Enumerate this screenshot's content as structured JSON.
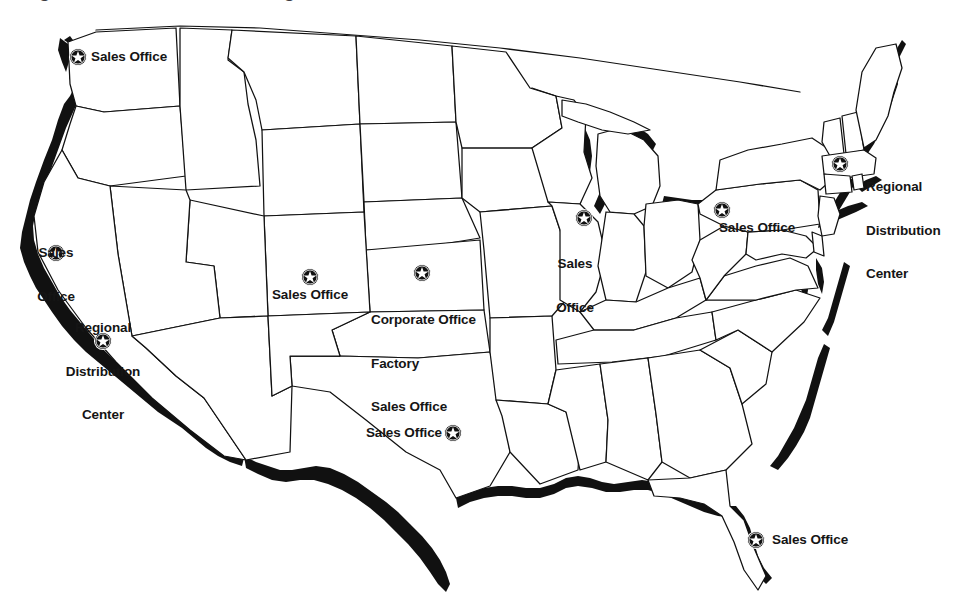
{
  "page": {
    "title_fragment": "Regional sales, manufacturing and distribution locations",
    "background_color": "#ffffff",
    "ink_color": "#111111",
    "width": 968,
    "height": 611
  },
  "map": {
    "name": "united-states-map",
    "region": "Continental United States",
    "outline_color": "#111111",
    "fill_color": "#ffffff",
    "coastline_style": "thick black shadow band"
  },
  "legend_terms": {
    "sales_office": "Sales Office",
    "regional_distribution_center": "Regional Distribution Center",
    "corporate_office": "Corporate Office",
    "factory": "Factory"
  },
  "markers": [
    {
      "id": "marker-washington",
      "icon": "star-in-circle-icon",
      "state": "Washington",
      "label_lines": [
        "Sales Office"
      ],
      "label_text": "Sales Office",
      "x": 78,
      "y": 57,
      "label_x": 91,
      "label_y": 50,
      "align": "left"
    },
    {
      "id": "marker-northern-california",
      "icon": "star-in-circle-icon",
      "state": "Northern California",
      "label_lines": [
        "Sales",
        "Office"
      ],
      "label_text": "Sales Office",
      "x": 56,
      "y": 253,
      "label_x": 56,
      "label_y": 217,
      "align": "center"
    },
    {
      "id": "marker-southern-california",
      "icon": "star-in-circle-icon",
      "state": "Southern California",
      "label_lines": [
        "Regional",
        "Distribution",
        "Center"
      ],
      "label_text": "Regional Distribution Center",
      "x": 103,
      "y": 341,
      "label_x": 103,
      "label_y": 292,
      "align": "center"
    },
    {
      "id": "marker-colorado",
      "icon": "star-in-circle-icon",
      "state": "Colorado",
      "label_lines": [
        "Sales Office"
      ],
      "label_text": "Sales Office",
      "x": 310,
      "y": 277,
      "label_x": 310,
      "label_y": 288,
      "align": "center"
    },
    {
      "id": "marker-kansas",
      "icon": "star-in-circle-icon",
      "state": "Kansas",
      "label_lines": [
        "Corporate Office",
        "Factory",
        "Sales Office"
      ],
      "label_text": "Corporate Office Factory Sales Office",
      "x": 422,
      "y": 273,
      "label_x": 371,
      "label_y": 284,
      "align": "left"
    },
    {
      "id": "marker-texas",
      "icon": "star-in-circle-icon",
      "state": "Texas",
      "label_lines": [
        "Sales Office"
      ],
      "label_text": "Sales Office",
      "x": 453,
      "y": 433,
      "label_x": 442,
      "label_y": 426,
      "align": "right"
    },
    {
      "id": "marker-illinois",
      "icon": "star-in-circle-icon",
      "state": "Illinois",
      "label_lines": [
        "Sales",
        "Office"
      ],
      "label_text": "Sales Office",
      "x": 584,
      "y": 218,
      "label_x": 575,
      "label_y": 228,
      "align": "center"
    },
    {
      "id": "marker-pennsylvania",
      "icon": "star-in-circle-icon",
      "state": "Pennsylvania",
      "label_lines": [
        "Sales Office"
      ],
      "label_text": "Sales Office",
      "x": 722,
      "y": 210,
      "label_x": 716,
      "label_y": 221,
      "align": "center"
    },
    {
      "id": "marker-connecticut",
      "icon": "star-in-circle-icon",
      "state": "Connecticut",
      "label_lines": [
        "Regional",
        "Distribution",
        "Center"
      ],
      "label_text": "Regional Distribution Center",
      "x": 840,
      "y": 164,
      "label_x": 866,
      "label_y": 151,
      "align": "left"
    },
    {
      "id": "marker-florida",
      "icon": "star-in-circle-icon",
      "state": "Florida",
      "label_lines": [
        "Sales Office"
      ],
      "label_text": "Sales Office",
      "x": 756,
      "y": 540,
      "label_x": 772,
      "label_y": 533,
      "align": "left"
    }
  ]
}
